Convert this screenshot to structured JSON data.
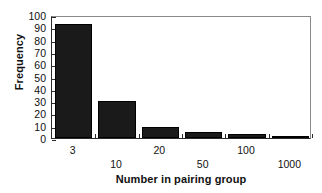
{
  "chart_data": {
    "type": "bar",
    "title": "",
    "subtitle": "",
    "xlabel": "Number in pairing group",
    "ylabel": "Frequency",
    "categories": [
      "3",
      "10",
      "20",
      "50",
      "100",
      "1000"
    ],
    "values": [
      93,
      30,
      9,
      5,
      3,
      1
    ],
    "series": [
      {
        "name": "Frequency",
        "values": [
          93,
          30,
          9,
          5,
          3,
          1
        ]
      }
    ],
    "ylim": [
      0,
      100
    ],
    "ytick_labels": [
      "100",
      "90",
      "80",
      "70",
      "60",
      "50",
      "40",
      "30",
      "20",
      "10",
      "0"
    ],
    "ytick_values": [
      100,
      90,
      80,
      70,
      60,
      50,
      40,
      30,
      20,
      10,
      0
    ],
    "xtick_labels": [
      "3",
      "10",
      "20",
      "50",
      "100",
      "1000"
    ],
    "xtick_label_rows": [
      0,
      1,
      0,
      1,
      0,
      1
    ],
    "grid": false,
    "legend": false,
    "legend_position": "none",
    "bar_color": "#1a1a1a",
    "axis_color": "#2b2b2b",
    "background_color": "#ffffff",
    "annotations": []
  }
}
